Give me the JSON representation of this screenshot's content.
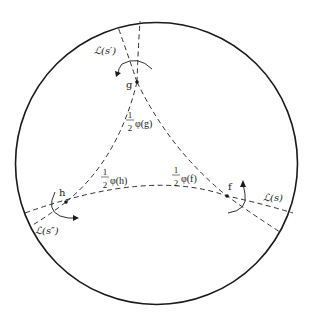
{
  "diagram": {
    "type": "hyperbolic-triangle-in-disk",
    "colors": {
      "stroke": "#1a1a1a",
      "background": "#ffffff"
    },
    "vertices": {
      "g": {
        "label": "g"
      },
      "h": {
        "label": "h"
      },
      "f": {
        "label": "f"
      }
    },
    "angle_labels": {
      "g": {
        "num": "1",
        "den": "2",
        "expr": "φ(g)"
      },
      "h": {
        "num": "1",
        "den": "2",
        "expr": "φ(h)"
      },
      "f": {
        "num": "1",
        "den": "2",
        "expr": "φ(f)"
      }
    },
    "geodesic_labels": {
      "s_prime": "ℒ(s′)",
      "s_double_prime": "ℒ(s″)",
      "s": "ℒ(s)"
    }
  }
}
